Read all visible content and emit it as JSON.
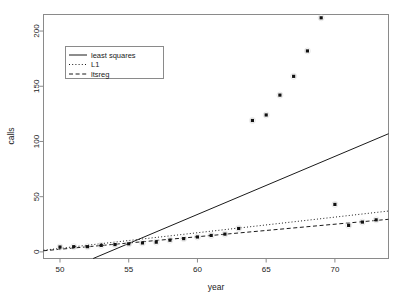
{
  "chart_data": {
    "type": "scatter",
    "title": "",
    "xlabel": "year",
    "ylabel": "calls",
    "xlim": [
      48.8,
      73.9
    ],
    "ylim": [
      -6,
      215
    ],
    "xticks": [
      50,
      55,
      60,
      65,
      70
    ],
    "yticks": [
      0,
      50,
      100,
      150,
      200
    ],
    "grid": false,
    "legend_position": "upper-left",
    "points": [
      {
        "x": 50,
        "y": 4.4
      },
      {
        "x": 51,
        "y": 4.7
      },
      {
        "x": 52,
        "y": 4.7
      },
      {
        "x": 53,
        "y": 5.9
      },
      {
        "x": 54,
        "y": 6.6
      },
      {
        "x": 55,
        "y": 7.3
      },
      {
        "x": 56,
        "y": 8.1
      },
      {
        "x": 57,
        "y": 8.8
      },
      {
        "x": 58,
        "y": 10.6
      },
      {
        "x": 59,
        "y": 12.0
      },
      {
        "x": 60,
        "y": 13.5
      },
      {
        "x": 61,
        "y": 14.9
      },
      {
        "x": 62,
        "y": 16.1
      },
      {
        "x": 63,
        "y": 21.2
      },
      {
        "x": 64,
        "y": 119.0
      },
      {
        "x": 65,
        "y": 124.0
      },
      {
        "x": 66,
        "y": 142.0
      },
      {
        "x": 67,
        "y": 159.0
      },
      {
        "x": 68,
        "y": 182.0
      },
      {
        "x": 69,
        "y": 212.0
      },
      {
        "x": 70,
        "y": 43.0
      },
      {
        "x": 71,
        "y": 24.0
      },
      {
        "x": 72,
        "y": 27.0
      },
      {
        "x": 73,
        "y": 29.0
      }
    ],
    "series": [
      {
        "name": "least squares",
        "style": "solid",
        "type": "line",
        "endpoints": [
          {
            "x": 48.8,
            "y": -25.0
          },
          {
            "x": 73.9,
            "y": 107.0
          }
        ]
      },
      {
        "name": "L1",
        "style": "dotted",
        "type": "line",
        "endpoints": [
          {
            "x": 48.8,
            "y": 1.5
          },
          {
            "x": 73.9,
            "y": 37.0
          }
        ]
      },
      {
        "name": "ltsreg",
        "style": "dashed",
        "type": "line",
        "endpoints": [
          {
            "x": 48.8,
            "y": 1.0
          },
          {
            "x": 73.9,
            "y": 29.5
          }
        ]
      }
    ]
  },
  "legend": {
    "entries": [
      {
        "label": "least squares"
      },
      {
        "label": "L1"
      },
      {
        "label": "ltsreg"
      }
    ]
  },
  "axes": {
    "x": {
      "title": "year",
      "tick_labels": [
        "50",
        "55",
        "60",
        "65",
        "70"
      ]
    },
    "y": {
      "title": "calls",
      "tick_labels": [
        "0",
        "50",
        "100",
        "150",
        "200"
      ]
    }
  }
}
